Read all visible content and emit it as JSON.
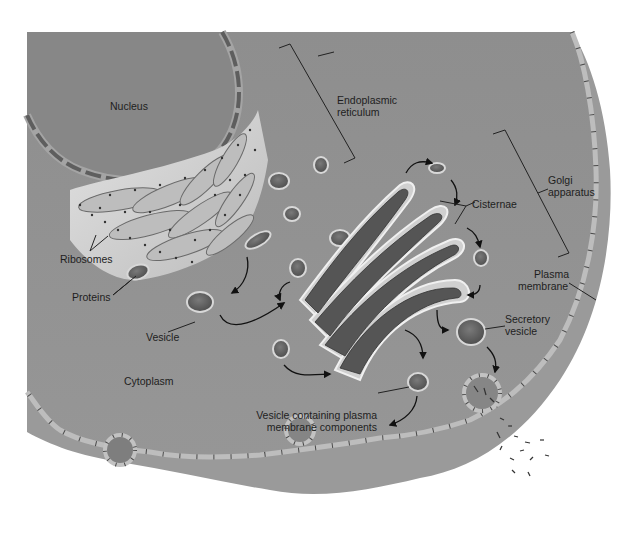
{
  "diagram": {
    "colors": {
      "background": "#ffffff",
      "cytoplasm": "#8f8f8f",
      "cytoplasm_dark": "#7d7d7d",
      "outer_membrane_rim": "#a6a6a6",
      "membrane": "#b9b9b9",
      "membrane_tick": "#4a4a4a",
      "nucleus": "#878787",
      "nuclear_envelope": "#9b9b9b",
      "er_light": "#d6d6d6",
      "er_cisterna": "#bdbdbd",
      "lumen_dark": "#5d5d5d",
      "highlight": "#eeeeee",
      "text": "#1e1e1e",
      "leader_line": "#222222"
    },
    "labels": {
      "nucleus": "Nucleus",
      "er_line1": "Endoplasmic",
      "er_line2": "reticulum",
      "golgi_line1": "Golgi",
      "golgi_line2": "apparatus",
      "cisternae": "Cisternae",
      "ribosomes": "Ribosomes",
      "proteins": "Proteins",
      "vesicle": "Vesicle",
      "plasma_line1": "Plasma",
      "plasma_line2": "membrane",
      "secretory_line1": "Secretory",
      "secretory_line2": "vesicle",
      "cytoplasm": "Cytoplasm",
      "vcpm_line1": "Vesicle containing plasma",
      "vcpm_line2": "membrane components"
    },
    "components": [
      "nucleus",
      "nuclear-envelope",
      "rough-endoplasmic-reticulum",
      "ribosomes",
      "transport-vesicles",
      "golgi-cisternae",
      "secretory-vesicle",
      "exocytosis-site",
      "plasma-membrane",
      "cytoplasm"
    ]
  }
}
